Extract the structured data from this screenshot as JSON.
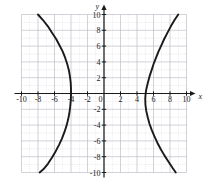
{
  "chart_data": {
    "type": "line",
    "title": "",
    "subtitle": "",
    "xlabel": "x",
    "ylabel": "y",
    "xlim": [
      -10,
      10
    ],
    "ylim": [
      -10,
      10
    ],
    "grid": true,
    "grid_step": 1,
    "legend": "none",
    "x_ticks": [
      -10,
      -8,
      -6,
      -4,
      -2,
      0,
      2,
      4,
      6,
      8,
      10
    ],
    "x_tick_labels": [
      "-10",
      "-8",
      "-6",
      "-4",
      "-2",
      "0",
      "2",
      "4",
      "6",
      "8",
      "10"
    ],
    "y_ticks": [
      -10,
      -8,
      -6,
      -4,
      -2,
      2,
      4,
      6,
      8,
      10
    ],
    "y_tick_labels": [
      "-10",
      "-8",
      "-6",
      "-4",
      "-2",
      "2",
      "4",
      "6",
      "8",
      "10"
    ],
    "curve_color": "#1a1a1a",
    "grid_color": "#b9b9c4",
    "axis_color": "#1a1a1a",
    "series": [
      {
        "name": "left-branch",
        "points": [
          [
            -8.0,
            10.0
          ],
          [
            -7.4,
            9.3
          ],
          [
            -6.8,
            8.5
          ],
          [
            -6.3,
            7.7
          ],
          [
            -5.8,
            6.9
          ],
          [
            -5.4,
            6.1
          ],
          [
            -5.0,
            5.3
          ],
          [
            -4.7,
            4.5
          ],
          [
            -4.45,
            3.7
          ],
          [
            -4.25,
            2.9
          ],
          [
            -4.12,
            2.1
          ],
          [
            -4.03,
            1.3
          ],
          [
            -4.0,
            0.5
          ],
          [
            -4.0,
            0.0
          ],
          [
            -4.02,
            -0.8
          ],
          [
            -4.1,
            -1.7
          ],
          [
            -4.2,
            -2.5
          ],
          [
            -4.35,
            -3.3
          ],
          [
            -4.55,
            -4.1
          ],
          [
            -4.8,
            -4.9
          ],
          [
            -5.1,
            -5.7
          ],
          [
            -5.45,
            -6.5
          ],
          [
            -5.85,
            -7.3
          ],
          [
            -6.3,
            -8.1
          ],
          [
            -6.8,
            -8.9
          ],
          [
            -7.35,
            -9.6
          ],
          [
            -7.8,
            -10.0
          ]
        ]
      },
      {
        "name": "right-branch",
        "points": [
          [
            9.0,
            10.0
          ],
          [
            8.55,
            9.3
          ],
          [
            8.1,
            8.5
          ],
          [
            7.7,
            7.7
          ],
          [
            7.3,
            6.9
          ],
          [
            6.95,
            6.1
          ],
          [
            6.6,
            5.3
          ],
          [
            6.3,
            4.5
          ],
          [
            6.0,
            3.7
          ],
          [
            5.75,
            2.9
          ],
          [
            5.5,
            2.1
          ],
          [
            5.3,
            1.3
          ],
          [
            5.12,
            0.5
          ],
          [
            5.05,
            0.0
          ],
          [
            5.0,
            -0.6
          ],
          [
            5.02,
            -1.4
          ],
          [
            5.12,
            -2.2
          ],
          [
            5.3,
            -3.0
          ],
          [
            5.5,
            -3.8
          ],
          [
            5.78,
            -4.6
          ],
          [
            6.1,
            -5.4
          ],
          [
            6.45,
            -6.2
          ],
          [
            6.85,
            -7.0
          ],
          [
            7.3,
            -7.8
          ],
          [
            7.8,
            -8.6
          ],
          [
            8.3,
            -9.4
          ],
          [
            8.7,
            -10.0
          ]
        ]
      }
    ]
  }
}
